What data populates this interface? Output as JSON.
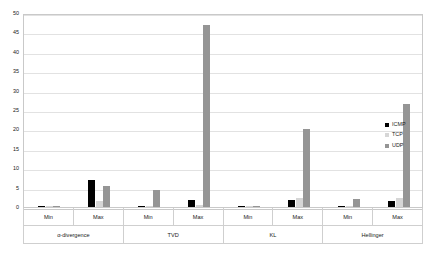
{
  "chart_data": {
    "type": "bar",
    "title": "",
    "xlabel": "",
    "ylabel": "",
    "ylim": [
      0,
      50
    ],
    "y_ticks": [
      0,
      5,
      10,
      15,
      20,
      25,
      30,
      35,
      40,
      45,
      50
    ],
    "grid": true,
    "legend_position": "right",
    "groups": [
      "α-divergence",
      "TVD",
      "KL",
      "Hellinger"
    ],
    "subcategories": [
      "Min",
      "Max"
    ],
    "categories": [
      "α-divergence Min",
      "α-divergence Max",
      "TVD Min",
      "TVD Max",
      "KL Min",
      "KL Max",
      "Hellinger Min",
      "Hellinger Max"
    ],
    "series": [
      {
        "name": "ICMP",
        "color": "#000000",
        "values": [
          0.2,
          7.0,
          0.2,
          1.8,
          0.05,
          1.8,
          0.3,
          1.5
        ]
      },
      {
        "name": "TCP",
        "color": "#d6d6d6",
        "values": [
          0.05,
          1.5,
          0.3,
          0.4,
          0.05,
          2.2,
          0.2,
          2.2
        ]
      },
      {
        "name": "UDP",
        "color": "#959595",
        "values": [
          0.15,
          5.5,
          4.5,
          47.0,
          0.2,
          20.0,
          2.0,
          26.5
        ]
      }
    ]
  },
  "axis": {
    "y_tick_labels": [
      "0",
      "5",
      "10",
      "15",
      "20",
      "25",
      "30",
      "35",
      "40",
      "45",
      "50"
    ],
    "sub_labels": [
      "Min",
      "Max",
      "Min",
      "Max",
      "Min",
      "Max",
      "Min",
      "Max"
    ],
    "group_labels": [
      "α-divergence",
      "TVD",
      "KL",
      "Hellinger"
    ]
  },
  "legend": {
    "items": [
      {
        "label": "ICMP",
        "color": "#000000"
      },
      {
        "label": "TCP",
        "color": "#d6d6d6"
      },
      {
        "label": "UDP",
        "color": "#959595"
      }
    ]
  }
}
